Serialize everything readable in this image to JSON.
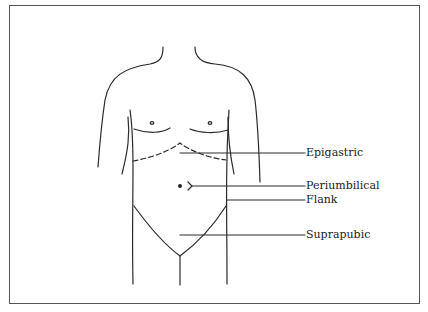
{
  "diagram": {
    "line_color": "#2a2a2a",
    "frame_color": "#555555",
    "labels": [
      {
        "id": "epigastric",
        "text": "Epigastric",
        "leader_y": 153
      },
      {
        "id": "periumbilical",
        "text": "Periumbilical",
        "leader_y": 186
      },
      {
        "id": "flank",
        "text": "Flank",
        "leader_y": 200
      },
      {
        "id": "suprapubic",
        "text": "Suprapubic",
        "leader_y": 235
      }
    ]
  }
}
